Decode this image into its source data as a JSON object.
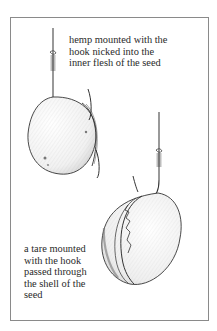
{
  "figure": {
    "captions": {
      "top": {
        "lines": [
          "hemp mounted with the",
          "hook nicked into the",
          "inner flesh of the seed"
        ]
      },
      "bottom": {
        "lines": [
          "a tare mounted",
          "with the hook",
          "passed through",
          "the shell of the",
          "seed"
        ]
      }
    },
    "illustrations": [
      {
        "name": "hemp-seed-on-hook",
        "description": "hemp seed with hook nicked into inner flesh"
      },
      {
        "name": "tare-seed-on-hook",
        "description": "tare with hook passed through shell"
      }
    ],
    "colors": {
      "ink": "#2a2a2a",
      "frame": "#8a8a8a",
      "paper": "#ffffff"
    }
  }
}
